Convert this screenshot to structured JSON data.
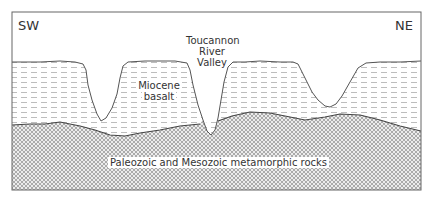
{
  "diagram": {
    "type": "geologic-cross-section",
    "orientation": {
      "left": "SW",
      "right": "NE"
    },
    "labels": {
      "valley_line1": "Toucannon",
      "valley_line2": "River",
      "valley_line3": "Valley",
      "basalt_line1": "Miocene",
      "basalt_line2": "basalt",
      "basement": "Paleozoic and Mesozoic metamorphic rocks"
    },
    "units": [
      {
        "name": "Miocene basalt",
        "pattern": "horizontal-dashes"
      },
      {
        "name": "Paleozoic and Mesozoic metamorphic rocks",
        "pattern": "cross-hatch"
      }
    ],
    "colors": {
      "line": "#555555",
      "hatch": "#9a9a9a",
      "dash": "#b0b0b0",
      "background": "#ffffff"
    }
  }
}
